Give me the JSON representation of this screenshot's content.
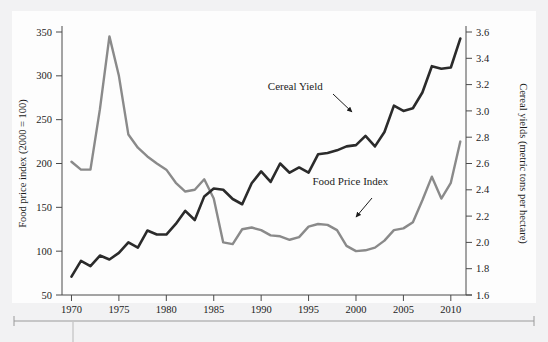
{
  "figure": {
    "background_color": "#f2f2f3",
    "panel_color": "#fdfdfd",
    "bottom_rule": "page-rule"
  },
  "chart_data": {
    "type": "line",
    "title": "",
    "subtitle": "",
    "xlabel": "",
    "ylabel": "Food price index (2000 = 100)",
    "y2label": "Cereal yields (metric tons per hectare)",
    "xlim": [
      1969,
      2011.6
    ],
    "ylim": [
      50,
      350
    ],
    "y2lim": [
      1.6,
      3.6
    ],
    "grid": false,
    "legend_position": "inline-annotations",
    "xticks": [
      1970,
      1975,
      1980,
      1985,
      1990,
      1995,
      2000,
      2005,
      2010
    ],
    "xticklabels": [
      "1970",
      "1975",
      "1980",
      "1985",
      "1990",
      "1995",
      "2000",
      "2005",
      "2010"
    ],
    "yticks": [
      50,
      100,
      150,
      200,
      250,
      300,
      350
    ],
    "yticklabels": [
      "50",
      "100",
      "150",
      "200",
      "250",
      "300",
      "350"
    ],
    "y2ticks": [
      1.6,
      1.8,
      2.0,
      2.2,
      2.4,
      2.6,
      2.8,
      3.0,
      3.2,
      3.4,
      3.6
    ],
    "y2ticklabels": [
      "1.6",
      "1.8",
      "2.0",
      "2.2",
      "2.4",
      "2.6",
      "2.8",
      "3.0",
      "3.2",
      "3.4",
      "3.6"
    ],
    "x": [
      1970,
      1971,
      1972,
      1973,
      1974,
      1975,
      1976,
      1977,
      1978,
      1979,
      1980,
      1981,
      1982,
      1983,
      1984,
      1985,
      1986,
      1987,
      1988,
      1989,
      1990,
      1991,
      1992,
      1993,
      1994,
      1995,
      1996,
      1997,
      1998,
      1999,
      2000,
      2001,
      2002,
      2003,
      2004,
      2005,
      2006,
      2007,
      2008,
      2009,
      2010,
      2011
    ],
    "series": [
      {
        "name": "Food Price Index",
        "axis": "left",
        "color": "#8a8a8a",
        "values": [
          202,
          193,
          193,
          262,
          345,
          300,
          233,
          218,
          208,
          200,
          193,
          178,
          168,
          170,
          182,
          160,
          110,
          108,
          125,
          127,
          124,
          118,
          117,
          113,
          116,
          128,
          131,
          130,
          124,
          106,
          100,
          101,
          104,
          112,
          124,
          126,
          133,
          158,
          185,
          160,
          178,
          225
        ]
      },
      {
        "name": "Cereal Yield",
        "axis": "right",
        "color": "#2b2b2b",
        "values": [
          1.74,
          1.86,
          1.82,
          1.9,
          1.87,
          1.92,
          2.0,
          1.96,
          2.09,
          2.06,
          2.06,
          2.14,
          2.24,
          2.17,
          2.35,
          2.41,
          2.4,
          2.33,
          2.29,
          2.45,
          2.54,
          2.46,
          2.6,
          2.53,
          2.57,
          2.53,
          2.67,
          2.68,
          2.7,
          2.73,
          2.74,
          2.81,
          2.73,
          2.84,
          3.04,
          3.0,
          3.02,
          3.14,
          3.34,
          3.32,
          3.33,
          3.55
        ]
      }
    ],
    "annotations": [
      {
        "text": "Cereal Yield",
        "target_series": "Cereal Yield",
        "x": 1993.6,
        "y_label_left_scale": 284
      },
      {
        "text": "Food Price Index",
        "target_series": "Food Price Index",
        "x": 1999.4,
        "y_label_left_scale": 176
      }
    ]
  }
}
